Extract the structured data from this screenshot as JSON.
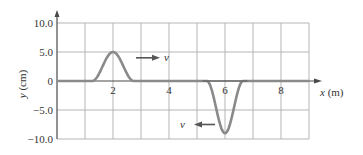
{
  "chart_data": {
    "type": "line",
    "title": "",
    "xlabel": "x (m)",
    "ylabel": "y (cm)",
    "xlim": [
      0,
      9
    ],
    "ylim": [
      -10,
      10
    ],
    "grid": true,
    "x_ticks": [
      {
        "value": 2,
        "label": "2"
      },
      {
        "value": 4,
        "label": "4"
      },
      {
        "value": 6,
        "label": "6"
      },
      {
        "value": 8,
        "label": "8"
      }
    ],
    "y_ticks": [
      {
        "value": 10,
        "label": "10.0"
      },
      {
        "value": 5,
        "label": "5.0"
      },
      {
        "value": 0,
        "label": "0"
      },
      {
        "value": -5,
        "label": "-5.0"
      },
      {
        "value": -10,
        "label": "-10.0"
      }
    ],
    "series": [
      {
        "name": "wave pulse 1",
        "shape": "smooth bump",
        "center_x": 2,
        "amplitude": 5.0,
        "half_width": 0.75,
        "direction": "right",
        "velocity_label": "v"
      },
      {
        "name": "wave pulse 2",
        "shape": "smooth dip",
        "center_x": 6,
        "amplitude": -9.0,
        "half_width": 0.65,
        "direction": "left",
        "velocity_label": "v"
      }
    ],
    "annotations": [
      {
        "text": "v",
        "arrow": "right",
        "near_x": 3.2,
        "near_y": 4.2
      },
      {
        "text": "v",
        "arrow": "left",
        "near_x": 5.0,
        "near_y": -7.5
      }
    ],
    "colors": {
      "curve": "#8a8a8a",
      "grid": "#b5b5b5",
      "axis": "#4a4a4a",
      "arrow": "#555555"
    }
  }
}
